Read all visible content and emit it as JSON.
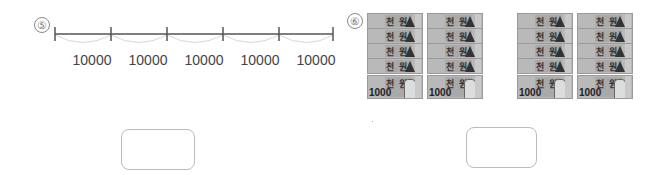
{
  "problems": [
    {
      "number": "⑤",
      "type": "number-line",
      "segment_labels": [
        "10000",
        "10000",
        "10000",
        "10000",
        "10000"
      ],
      "answer_box": {
        "value": ""
      }
    },
    {
      "number": "⑥",
      "type": "banknotes",
      "note_label": "천 원",
      "note_value": "1000",
      "groups": [
        {
          "stacks": [
            {
              "count": 5
            },
            {
              "count": 5
            }
          ]
        },
        {
          "stacks": [
            {
              "count": 5
            },
            {
              "count": 5
            }
          ]
        }
      ],
      "answer_box": {
        "value": ""
      }
    }
  ],
  "colors": {
    "line": "#555555",
    "arc": "#d8d8d8",
    "note_bg": "#b9b9b9",
    "box_border": "#bbbbbb"
  }
}
